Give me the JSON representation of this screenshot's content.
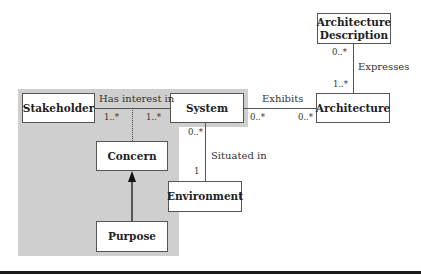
{
  "diagram": {
    "boxes": {
      "stakeholder": "Stakeholder",
      "system": "System",
      "architecture": "Architecture",
      "architecture_description_line1": "Architecture",
      "architecture_description_line2": "Description",
      "concern": "Concern",
      "purpose": "Purpose",
      "environment": "Environment"
    },
    "relations": {
      "has_interest_in": {
        "label": "Has interest in",
        "mult_left": "1..*",
        "mult_right": "1..*"
      },
      "exhibits": {
        "label": "Exhibits",
        "mult_left": "0..*",
        "mult_right": "0..*"
      },
      "expresses": {
        "label": "Expresses",
        "mult_top": "0..*",
        "mult_bottom": "1..*"
      },
      "situated_in": {
        "label": "Situated in",
        "mult_top": "0..*",
        "mult_bottom": "1"
      },
      "purpose_to_concern": {
        "type": "directed-arrow"
      }
    },
    "colors": {
      "highlight_region": "#cfcfcf",
      "box_border": "#555555",
      "rule": "#1a1a1a"
    }
  }
}
